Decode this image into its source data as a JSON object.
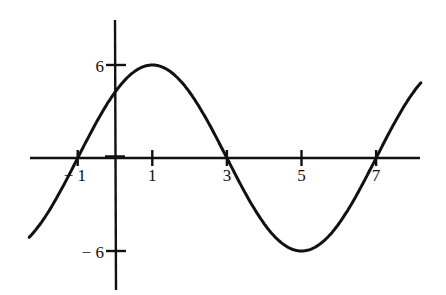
{
  "chart_data": {
    "type": "line",
    "title": "",
    "xlabel": "",
    "ylabel": "",
    "function": "y = 6 sin(pi (x + 1) / 4)",
    "amplitude": 6,
    "period": 8,
    "x_range": [
      -2.3,
      8.2
    ],
    "xlim": [
      -2.3,
      8.3
    ],
    "ylim": [
      -8.5,
      9
    ],
    "grid": false,
    "legend": null,
    "x_ticks": [
      -1,
      1,
      3,
      5,
      7
    ],
    "x_tick_labels": [
      "− 1",
      "1",
      "3",
      "5",
      "7"
    ],
    "y_ticks": [
      6,
      -6
    ],
    "y_tick_labels": [
      "6",
      "− 6"
    ],
    "key_points": [
      {
        "x": -1,
        "y": 0,
        "label": "zero"
      },
      {
        "x": 0,
        "y": 4.24,
        "label": "y-intercept"
      },
      {
        "x": 1,
        "y": 6,
        "label": "maximum"
      },
      {
        "x": 3,
        "y": 0,
        "label": "zero"
      },
      {
        "x": 5,
        "y": -6,
        "label": "minimum"
      },
      {
        "x": 7,
        "y": 0,
        "label": "zero"
      }
    ],
    "series": [
      {
        "name": "sinusoid",
        "x": [
          -2.3,
          -2,
          -1.5,
          -1,
          -0.5,
          0,
          0.5,
          1,
          1.5,
          2,
          2.5,
          3,
          3.5,
          4,
          4.5,
          5,
          5.5,
          6,
          6.5,
          7,
          7.5,
          8,
          8.2
        ],
        "y": [
          -5.6,
          -4.24,
          -2.3,
          0,
          2.3,
          4.24,
          5.54,
          6,
          5.54,
          4.24,
          2.3,
          0,
          -2.3,
          -4.24,
          -5.54,
          -6,
          -5.54,
          -4.24,
          -2.3,
          0,
          2.3,
          4.24,
          5.04
        ]
      }
    ]
  },
  "colors": {
    "axis": "#111111",
    "curve": "#111111",
    "background": "#ffffff"
  }
}
